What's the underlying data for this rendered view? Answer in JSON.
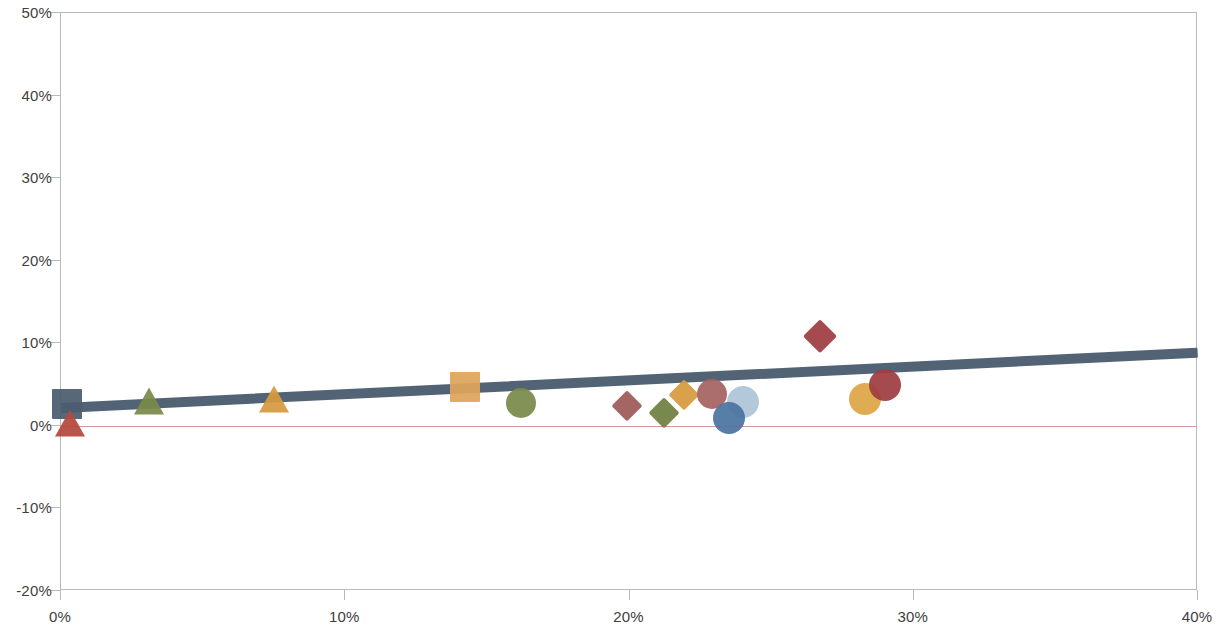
{
  "chart_data": {
    "type": "scatter",
    "title": "",
    "subtitle": "",
    "xlabel": "",
    "ylabel": "",
    "xlim": [
      0,
      40
    ],
    "ylim": [
      -20,
      50
    ],
    "grid": false,
    "legend": "none",
    "x_ticks": [
      "0%",
      "10%",
      "20%",
      "30%",
      "40%"
    ],
    "x_tick_values": [
      0,
      10,
      20,
      30,
      40
    ],
    "y_ticks": [
      "50%",
      "40%",
      "30%",
      "20%",
      "10%",
      "0%",
      "-10%",
      "-20%"
    ],
    "y_tick_values": [
      50,
      40,
      30,
      20,
      10,
      0,
      -10,
      -20
    ],
    "zero_line": {
      "value": 0,
      "color": "#c58a86"
    },
    "trendline": {
      "type": "linear",
      "x_start": 0.0,
      "y_start": 2.2,
      "x_end": 40.0,
      "y_end": 8.9,
      "color": "#4a5d6e",
      "width_px": 10
    },
    "points": [
      {
        "label": "point-1",
        "x": 0.2,
        "y": 2.6,
        "marker": "square",
        "color": "#4a5d6e",
        "size": 30
      },
      {
        "label": "point-2",
        "x": 0.3,
        "y": 2.0,
        "marker": "triangle",
        "color": "#b5493f",
        "size": 30
      },
      {
        "label": "point-3",
        "x": 3.1,
        "y": 4.7,
        "marker": "triangle",
        "color": "#7a8a4a",
        "size": 30
      },
      {
        "label": "point-4",
        "x": 7.5,
        "y": 4.9,
        "marker": "triangle",
        "color": "#d79a40",
        "size": 30
      },
      {
        "label": "point-5",
        "x": 14.2,
        "y": 4.7,
        "marker": "square",
        "color": "#dda55b",
        "size": 30
      },
      {
        "label": "point-6",
        "x": 16.2,
        "y": 2.8,
        "marker": "circle",
        "color": "#7a8a4a",
        "size": 30
      },
      {
        "label": "point-7",
        "x": 19.9,
        "y": 2.4,
        "marker": "diamond",
        "color": "#9e5a57",
        "size": 30
      },
      {
        "label": "point-8",
        "x": 21.2,
        "y": 1.5,
        "marker": "diamond",
        "color": "#6f7f3e",
        "size": 30
      },
      {
        "label": "point-9",
        "x": 21.9,
        "y": 3.7,
        "marker": "diamond",
        "color": "#d79a40",
        "size": 30
      },
      {
        "label": "point-10",
        "x": 22.9,
        "y": 3.8,
        "marker": "circle",
        "color": "#a56361",
        "size": 30
      },
      {
        "label": "point-11",
        "x": 24.0,
        "y": 2.9,
        "marker": "circle",
        "color": "#adc5d7",
        "size": 32
      },
      {
        "label": "point-12",
        "x": 23.5,
        "y": 0.9,
        "marker": "circle",
        "color": "#4a74a0",
        "size": 32
      },
      {
        "label": "point-13",
        "x": 26.7,
        "y": 10.9,
        "marker": "diamond",
        "color": "#9e3d42",
        "size": 32
      },
      {
        "label": "point-14",
        "x": 28.3,
        "y": 3.2,
        "marker": "circle",
        "color": "#dda546",
        "size": 32
      },
      {
        "label": "point-15",
        "x": 29.0,
        "y": 4.9,
        "marker": "circle",
        "color": "#9e3d42",
        "size": 32
      }
    ]
  },
  "colors": {
    "axis": "#b9b9b9",
    "axis_text": "#404040",
    "trend": "#4a5d6e",
    "zero_line": "#c58a86",
    "background": "#ffffff"
  }
}
